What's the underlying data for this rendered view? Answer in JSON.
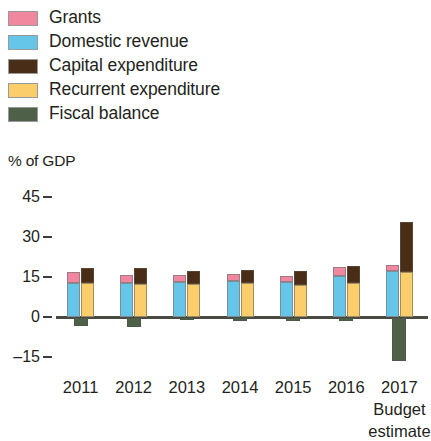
{
  "legend": {
    "items": [
      {
        "label": "Grants",
        "color": "#f1879f",
        "name": "grants"
      },
      {
        "label": "Domestic revenue",
        "color": "#66c6ea",
        "name": "domestic-revenue"
      },
      {
        "label": "Capital expenditure",
        "color": "#4a2d16",
        "name": "capital-expenditure"
      },
      {
        "label": "Recurrent expenditure",
        "color": "#fbcd6b",
        "name": "recurrent-expenditure"
      },
      {
        "label": "Fiscal balance",
        "color": "#4e6148",
        "name": "fiscal-balance"
      }
    ]
  },
  "axis": {
    "unit_caption": "% of GDP",
    "yticks": [
      "45",
      "30",
      "15",
      "0",
      "–15"
    ],
    "xlabels": [
      "2011",
      "2012",
      "2013",
      "2014",
      "2015",
      "2016",
      "2017"
    ],
    "x_sublabel_line1": "Budget",
    "x_sublabel_line2": "estimate"
  },
  "chart_data": {
    "type": "bar",
    "title": "",
    "subtitle": "",
    "xlabel": "",
    "ylabel": "% of GDP",
    "ylim": [
      -15,
      45
    ],
    "yticks": [
      -15,
      0,
      15,
      30,
      45
    ],
    "grid": false,
    "legend_position": "top-left",
    "categories": [
      "2011",
      "2012",
      "2013",
      "2014",
      "2015",
      "2016",
      "2017"
    ],
    "category_notes": {
      "2017": "Budget estimate"
    },
    "stacking": {
      "revenue_bar": [
        "Domestic revenue",
        "Grants"
      ],
      "expenditure_bar": [
        "Recurrent expenditure",
        "Capital expenditure"
      ],
      "balance_bar": [
        "Fiscal balance"
      ]
    },
    "series": [
      {
        "name": "Domestic revenue",
        "color": "#66c6ea",
        "stack": "revenue",
        "values": [
          12.8,
          12.6,
          13.0,
          13.6,
          13.3,
          15.3,
          17.4
        ]
      },
      {
        "name": "Grants",
        "color": "#f1879f",
        "stack": "revenue",
        "values": [
          3.9,
          3.3,
          2.8,
          2.5,
          2.2,
          3.3,
          2.2
        ]
      },
      {
        "name": "Recurrent expenditure",
        "color": "#fbcd6b",
        "stack": "expenditure",
        "values": [
          12.8,
          12.2,
          12.4,
          12.6,
          12.0,
          12.8,
          17.0
        ]
      },
      {
        "name": "Capital expenditure",
        "color": "#4a2d16",
        "stack": "expenditure",
        "values": [
          5.7,
          6.0,
          4.7,
          5.1,
          5.3,
          6.4,
          18.5
        ]
      },
      {
        "name": "Fiscal balance",
        "color": "#4e6148",
        "stack": "balance",
        "values": [
          -3.0,
          -3.4,
          -0.6,
          -1.1,
          -1.1,
          -1.1,
          -16.0
        ]
      }
    ]
  }
}
